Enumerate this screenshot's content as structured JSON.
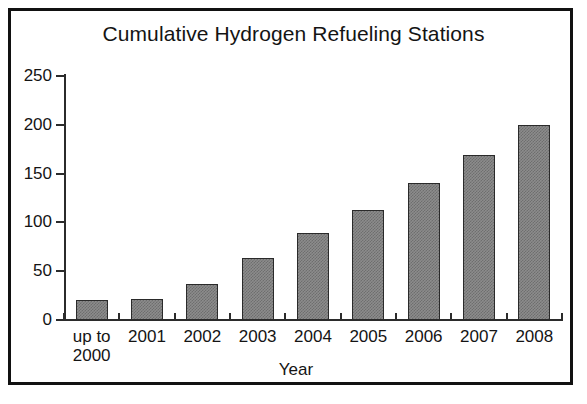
{
  "figure": {
    "background_color": "#ffffff",
    "frame_color": "#111111"
  },
  "chart_data": {
    "type": "bar",
    "title": "Cumulative Hydrogen Refueling Stations",
    "xlabel": "Year",
    "ylabel": "",
    "categories": [
      "up to\n2000",
      "2001",
      "2002",
      "2003",
      "2004",
      "2005",
      "2006",
      "2007",
      "2008"
    ],
    "values": [
      20,
      22,
      37,
      64,
      89,
      113,
      140,
      169,
      200
    ],
    "ylim": [
      0,
      250
    ],
    "yticks": [
      0,
      50,
      100,
      150,
      200,
      250
    ],
    "ytick_labels": [
      "0",
      "50",
      "100",
      "150",
      "200",
      "250"
    ],
    "grid": false,
    "legend": null,
    "bar_color": "#8c8c8c",
    "bar_edge_color": "#2a2a2a",
    "axis_color": "#2b2b2b"
  }
}
